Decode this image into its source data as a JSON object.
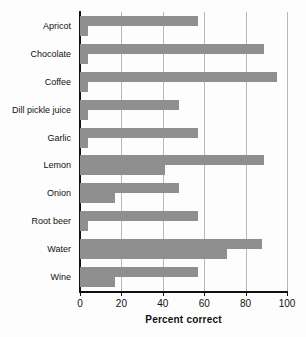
{
  "chart_data": {
    "type": "bar",
    "orientation": "horizontal",
    "title": "",
    "xlabel": "Percent correct",
    "ylabel": "",
    "xlim": [
      0,
      100
    ],
    "xticks": [
      0,
      20,
      40,
      60,
      80,
      100
    ],
    "xticklabels": [
      "0",
      "20",
      "40",
      "60",
      "80",
      "100"
    ],
    "grid": "vertical",
    "legend": "none",
    "bar_color": "#8f8f8f",
    "axis_color": "#111111",
    "gridline_color": "#b8b8b8",
    "categories": [
      "Apricot",
      "Chocolate",
      "Coffee",
      "Dill pickle juice",
      "Garlic",
      "Lemon",
      "Onion",
      "Root beer",
      "Water",
      "Wine"
    ],
    "series": [
      {
        "name": "Series 1",
        "values": [
          57,
          89,
          95,
          48,
          57,
          89,
          48,
          57,
          88,
          57
        ]
      },
      {
        "name": "Series 2",
        "values": [
          4,
          4,
          4,
          4,
          4,
          41,
          17,
          4,
          71,
          17
        ]
      }
    ]
  }
}
